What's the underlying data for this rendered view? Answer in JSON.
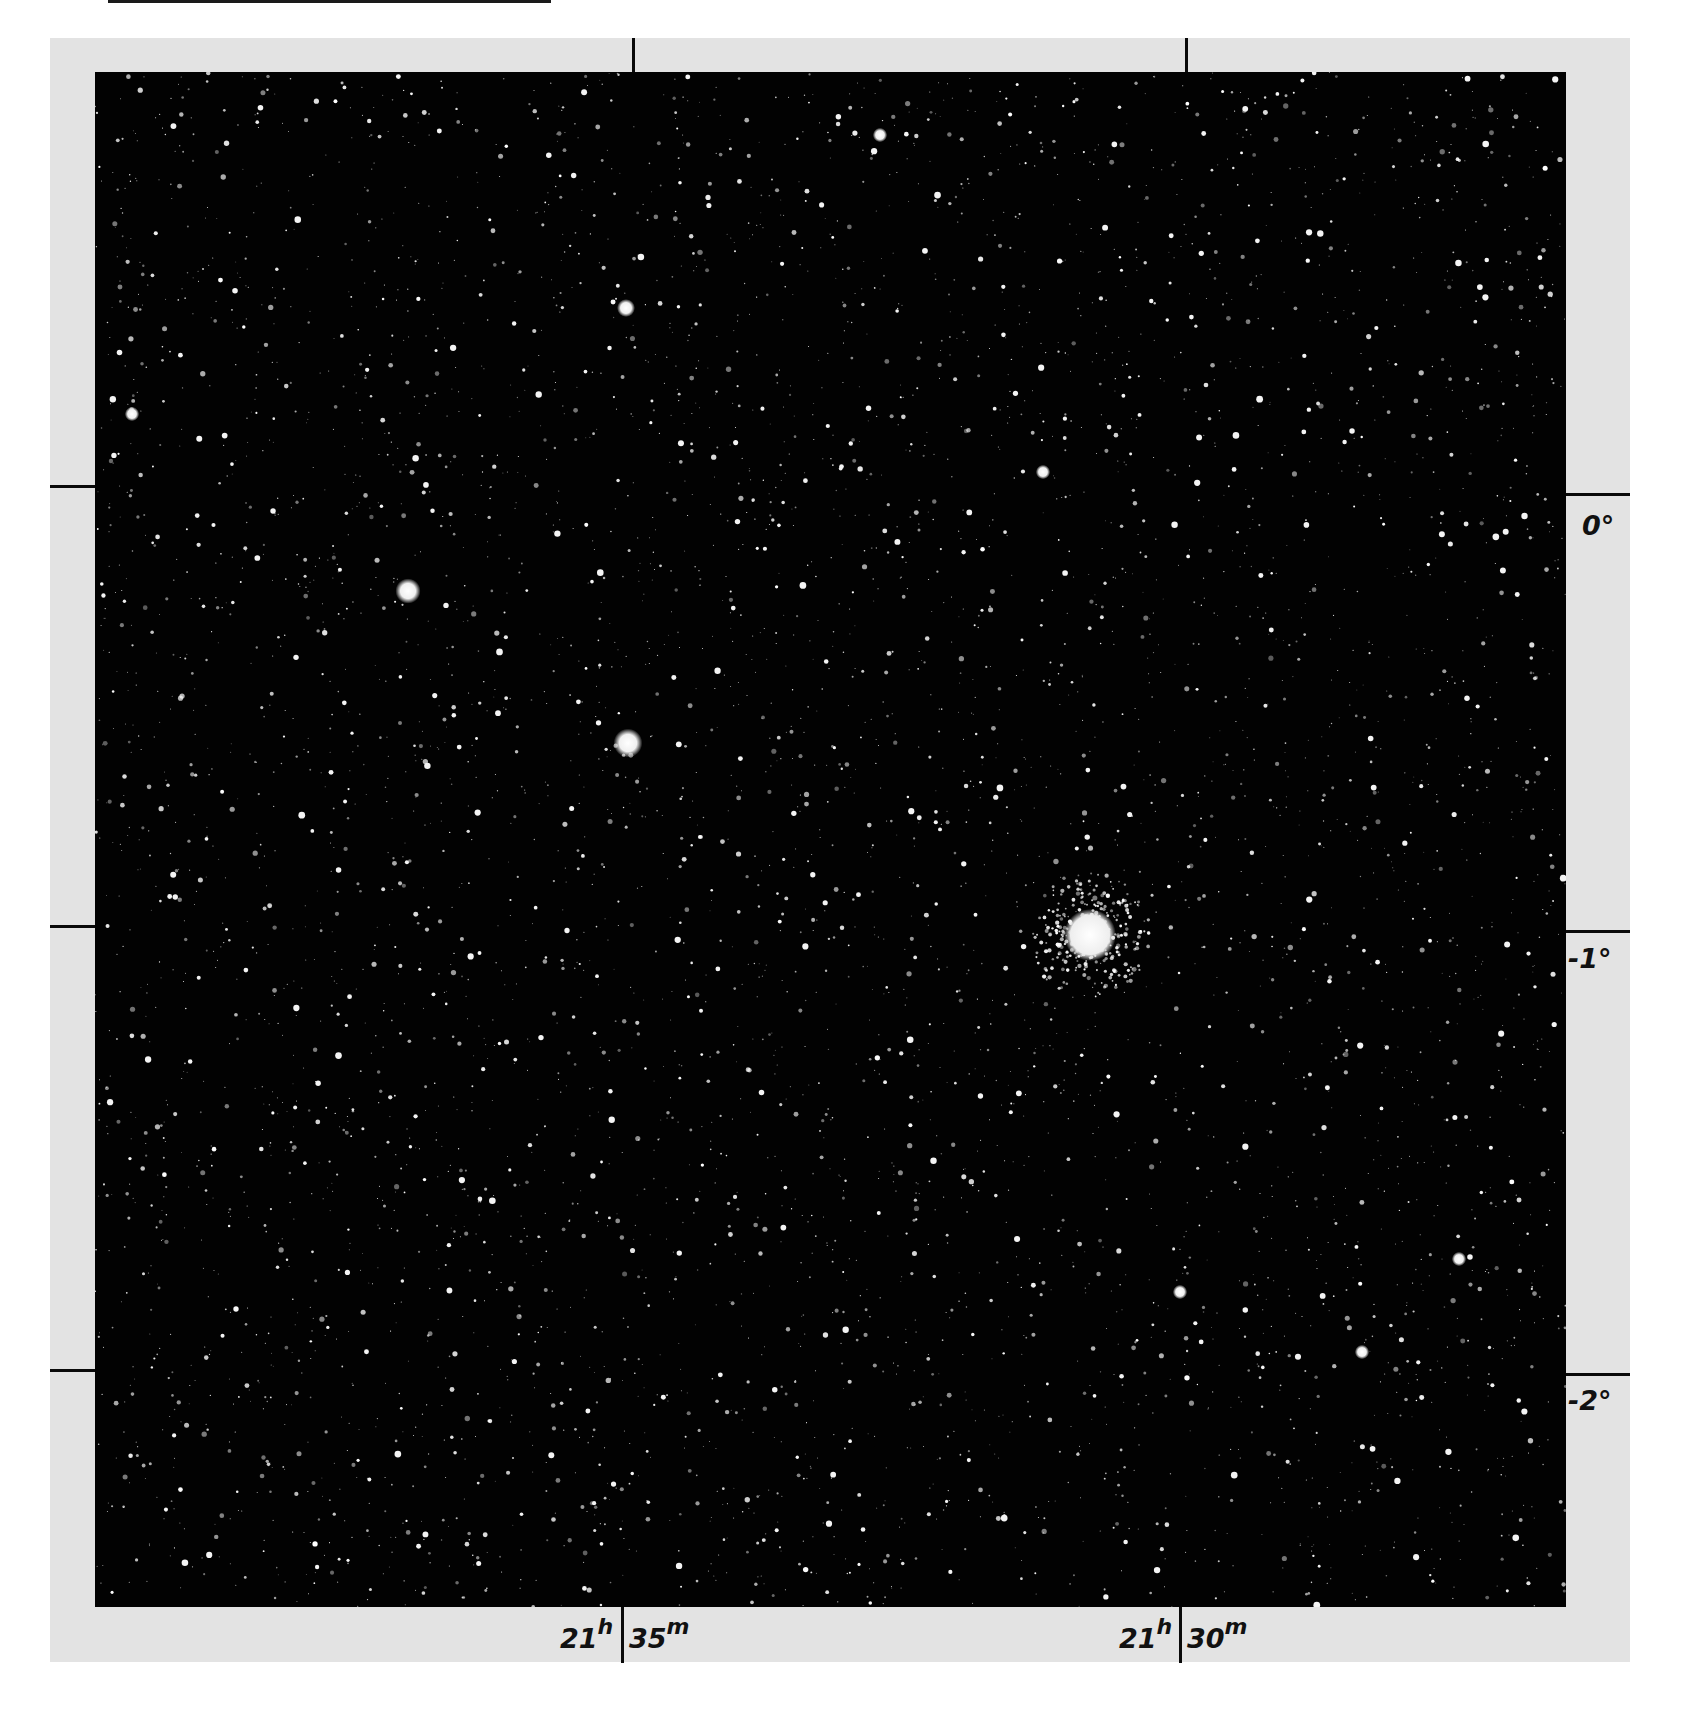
{
  "figure": {
    "type": "photographic sky chart plate",
    "background_color": "#020202",
    "frame_color": "#e3e3e3",
    "star_color": "#ffffff"
  },
  "axes": {
    "declination_labels": [
      {
        "text": "0°",
        "y": 494
      },
      {
        "text": "-1°",
        "y": 935
      },
      {
        "text": "-2°",
        "y": 1377
      }
    ],
    "right_ascension_labels": [
      {
        "hours": "21",
        "h_unit": "h",
        "minutes": "35",
        "m_unit": "m",
        "x": 622
      },
      {
        "hours": "21",
        "h_unit": "h",
        "minutes": "30",
        "m_unit": "m",
        "x": 1180
      }
    ]
  },
  "features": {
    "globular_cluster": {
      "x": 1090,
      "y": 935,
      "radius": 26
    },
    "bright_stars": [
      {
        "x": 408,
        "y": 591,
        "r": 7
      },
      {
        "x": 628,
        "y": 743,
        "r": 8
      },
      {
        "x": 626,
        "y": 308,
        "r": 5
      },
      {
        "x": 880,
        "y": 135,
        "r": 4
      },
      {
        "x": 132,
        "y": 414,
        "r": 4
      },
      {
        "x": 1043,
        "y": 472,
        "r": 4
      },
      {
        "x": 1180,
        "y": 1292,
        "r": 4
      },
      {
        "x": 1459,
        "y": 1259,
        "r": 4
      },
      {
        "x": 1362,
        "y": 1352,
        "r": 4
      }
    ]
  }
}
